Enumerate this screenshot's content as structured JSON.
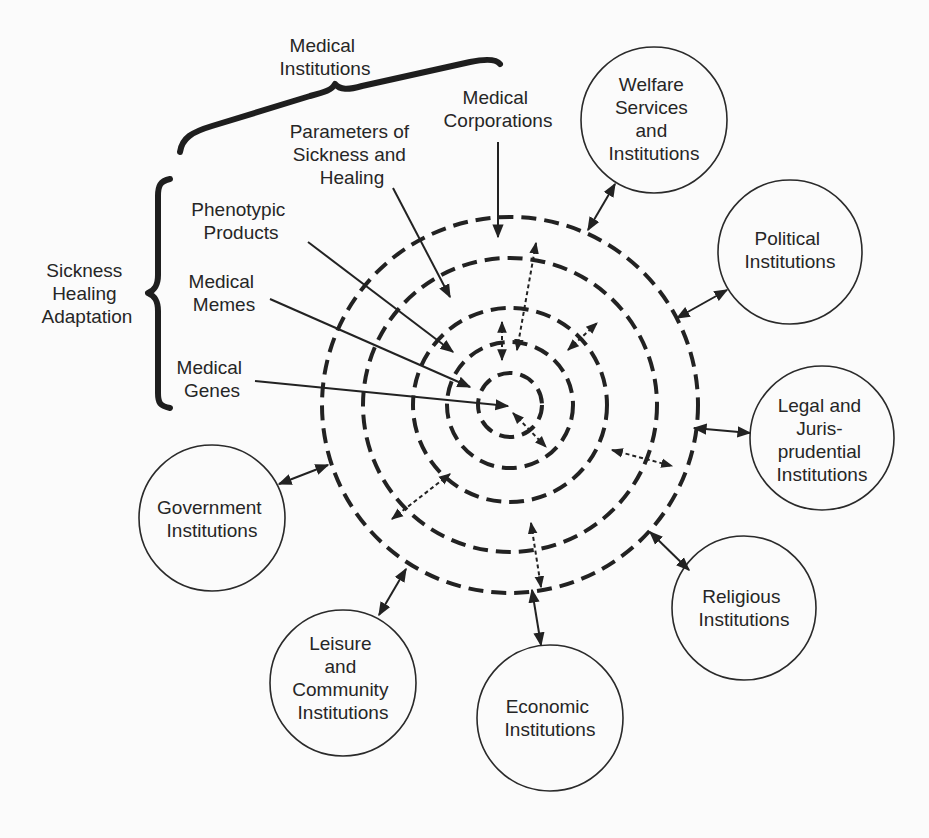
{
  "colors": {
    "background": "#fbfbfb",
    "ink": "#222222"
  },
  "center": {
    "x": 510,
    "y": 405
  },
  "rings": [
    {
      "name": "medical-genes-ring",
      "r": 32
    },
    {
      "name": "medical-memes-ring",
      "r": 63
    },
    {
      "name": "phenotypic-products-ring",
      "r": 97
    },
    {
      "name": "parameters-ring",
      "r": 147
    },
    {
      "name": "medical-corporations-ring",
      "r": 188
    }
  ],
  "top_group": {
    "label_lines": [
      "Medical",
      "Institutions"
    ]
  },
  "left_group": {
    "label_lines": [
      "Sickness",
      "Healing",
      "Adaptation"
    ]
  },
  "inner_labels": [
    {
      "id": "medical-corporations",
      "lines": [
        "Medical",
        "Corporations"
      ],
      "x": 498,
      "y": 104,
      "arrow": [
        498,
        142,
        498,
        237
      ]
    },
    {
      "id": "parameters-of-sickness-and-healing",
      "lines": [
        "Parameters of",
        "Sickness and",
        "Healing"
      ],
      "x": 352,
      "y": 138,
      "arrow": [
        393,
        163,
        450,
        297
      ]
    },
    {
      "id": "phenotypic-products",
      "lines": [
        "Phenotypic",
        "Products"
      ],
      "x": 241,
      "y": 216,
      "arrow": [
        308,
        242,
        453,
        352
      ]
    },
    {
      "id": "medical-memes",
      "lines": [
        "Medical",
        "Memes"
      ],
      "x": 224,
      "y": 288,
      "arrow": [
        270,
        299,
        470,
        387
      ]
    },
    {
      "id": "medical-genes",
      "lines": [
        "Medical",
        "Genes"
      ],
      "x": 212,
      "y": 374,
      "arrow": [
        255,
        381,
        508,
        406
      ]
    }
  ],
  "institutions": [
    {
      "id": "welfare",
      "lines": [
        "Welfare",
        "Services",
        "and",
        "Institutions"
      ],
      "cx": 654,
      "cy": 120,
      "r": 73,
      "arrow": [
        588,
        230,
        615,
        184
      ]
    },
    {
      "id": "political",
      "lines": [
        "Political",
        "Institutions"
      ],
      "cx": 790,
      "cy": 252,
      "r": 72,
      "arrow": [
        677,
        318,
        727,
        290
      ]
    },
    {
      "id": "legal",
      "lines": [
        "Legal and",
        "Juris-",
        "prudential",
        "Institutions"
      ],
      "cx": 822,
      "cy": 438,
      "r": 72,
      "arrow": [
        694,
        428,
        750,
        433
      ]
    },
    {
      "id": "religious",
      "lines": [
        "Religious",
        "Institutions"
      ],
      "cx": 744,
      "cy": 608,
      "r": 72,
      "arrow": [
        650,
        532,
        689,
        570
      ]
    },
    {
      "id": "economic",
      "lines": [
        "Economic",
        "Institutions"
      ],
      "cx": 550,
      "cy": 718,
      "r": 73,
      "arrow": [
        532,
        590,
        541,
        645
      ]
    },
    {
      "id": "leisure",
      "lines": [
        "Leisure",
        "and",
        "Community",
        "Institutions"
      ],
      "cx": 343,
      "cy": 683,
      "r": 73,
      "arrow": [
        406,
        569,
        379,
        615
      ]
    },
    {
      "id": "government",
      "lines": [
        "Government",
        "Institutions"
      ],
      "cx": 212,
      "cy": 518,
      "r": 73,
      "arrow": [
        328,
        465,
        279,
        484
      ]
    }
  ],
  "dotted_arrows": [
    [
      536,
      243,
      517,
      350
    ],
    [
      502,
      322,
      502,
      360
    ],
    [
      568,
      350,
      597,
      323
    ],
    [
      513,
      413,
      546,
      447
    ],
    [
      612,
      450,
      672,
      466
    ],
    [
      450,
      474,
      392,
      519
    ],
    [
      531,
      523,
      541,
      587
    ]
  ]
}
